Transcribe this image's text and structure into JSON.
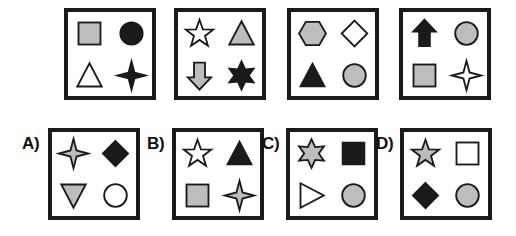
{
  "puzzle": {
    "type": "visual-analogy-shape-matrix",
    "colors": {
      "fill_gray": "#bdbdbd",
      "fill_black": "#1a1a1a",
      "fill_white": "#ffffff",
      "outline": "#1a1a1a",
      "background": "#ffffff"
    },
    "stimulus_row": {
      "name": "stimulus-row",
      "panels": [
        {
          "name": "stimulus-panel-1",
          "x": 64,
          "y": 8,
          "w": 92,
          "h": 92,
          "shapes": [
            {
              "shape": "square",
              "fill": "gray",
              "name": "gray-square"
            },
            {
              "shape": "circle",
              "fill": "black",
              "name": "black-circle"
            },
            {
              "shape": "triangle",
              "fill": "white",
              "name": "white-triangle"
            },
            {
              "shape": "star4",
              "fill": "black",
              "name": "black-four-pointed-star"
            }
          ]
        },
        {
          "name": "stimulus-panel-2",
          "x": 174,
          "y": 8,
          "w": 92,
          "h": 92,
          "shapes": [
            {
              "shape": "star5",
              "fill": "white",
              "name": "white-five-pointed-star"
            },
            {
              "shape": "triangle",
              "fill": "gray",
              "name": "gray-triangle"
            },
            {
              "shape": "arrowdown",
              "fill": "gray",
              "name": "gray-down-arrow"
            },
            {
              "shape": "star6",
              "fill": "black",
              "name": "black-six-pointed-star"
            }
          ]
        },
        {
          "name": "stimulus-panel-3",
          "x": 287,
          "y": 8,
          "w": 92,
          "h": 92,
          "shapes": [
            {
              "shape": "hexagon",
              "fill": "gray",
              "name": "gray-hexagon"
            },
            {
              "shape": "diamond",
              "fill": "white",
              "name": "white-diamond"
            },
            {
              "shape": "triangle",
              "fill": "black",
              "name": "black-triangle"
            },
            {
              "shape": "circle",
              "fill": "gray",
              "name": "gray-circle"
            }
          ]
        },
        {
          "name": "stimulus-panel-4",
          "x": 399,
          "y": 8,
          "w": 92,
          "h": 92,
          "shapes": [
            {
              "shape": "arrowup",
              "fill": "black",
              "name": "black-up-arrow"
            },
            {
              "shape": "circle",
              "fill": "gray",
              "name": "gray-circle"
            },
            {
              "shape": "square",
              "fill": "gray",
              "name": "gray-square"
            },
            {
              "shape": "star4",
              "fill": "white",
              "name": "white-four-pointed-star"
            }
          ]
        }
      ]
    },
    "answer_row": {
      "name": "answer-options-row",
      "options": [
        {
          "name": "answer-option-a",
          "label": "A)",
          "label_x": 22,
          "label_y": 135,
          "x": 48,
          "y": 128,
          "w": 92,
          "h": 92,
          "shapes": [
            {
              "shape": "star4",
              "fill": "gray",
              "name": "gray-four-pointed-star"
            },
            {
              "shape": "diamond",
              "fill": "black",
              "name": "black-diamond"
            },
            {
              "shape": "triangledown",
              "fill": "gray",
              "name": "gray-down-triangle"
            },
            {
              "shape": "circle",
              "fill": "white",
              "name": "white-circle"
            }
          ]
        },
        {
          "name": "answer-option-b",
          "label": "B)",
          "label_x": 147,
          "label_y": 135,
          "x": 172,
          "y": 128,
          "w": 92,
          "h": 92,
          "shapes": [
            {
              "shape": "star5",
              "fill": "white",
              "name": "white-five-pointed-star"
            },
            {
              "shape": "triangle",
              "fill": "black",
              "name": "black-triangle"
            },
            {
              "shape": "square",
              "fill": "gray",
              "name": "gray-square"
            },
            {
              "shape": "star4",
              "fill": "gray",
              "name": "gray-four-pointed-star"
            }
          ]
        },
        {
          "name": "answer-option-c",
          "label": "C)",
          "label_x": 262,
          "label_y": 135,
          "x": 286,
          "y": 128,
          "w": 92,
          "h": 92,
          "shapes": [
            {
              "shape": "star6",
              "fill": "gray",
              "name": "gray-six-pointed-star"
            },
            {
              "shape": "square",
              "fill": "black",
              "name": "black-square"
            },
            {
              "shape": "triangleright",
              "fill": "white",
              "name": "white-right-triangle"
            },
            {
              "shape": "circle",
              "fill": "gray",
              "name": "gray-circle"
            }
          ]
        },
        {
          "name": "answer-option-d",
          "label": "D)",
          "label_x": 376,
          "label_y": 135,
          "x": 400,
          "y": 128,
          "w": 92,
          "h": 92,
          "shapes": [
            {
              "shape": "star5",
              "fill": "gray",
              "name": "gray-five-pointed-star"
            },
            {
              "shape": "square",
              "fill": "white",
              "name": "white-square"
            },
            {
              "shape": "diamond",
              "fill": "black",
              "name": "black-diamond"
            },
            {
              "shape": "circle",
              "fill": "gray",
              "name": "gray-circle"
            }
          ]
        }
      ]
    }
  }
}
